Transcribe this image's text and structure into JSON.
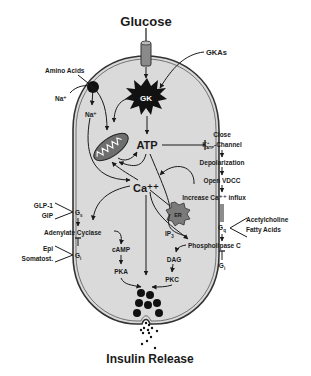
{
  "title": "Glucose",
  "footer": "Insulin Release",
  "inputs": {
    "gkas": "GKAs",
    "amino_acids": "Amino Acids",
    "na_out": "Na⁺",
    "na_in": "Na⁺"
  },
  "core": {
    "gk": "GK",
    "mito": "Mito",
    "atp": "ATP",
    "ca": "Ca⁺⁺",
    "er": "ER"
  },
  "katp_pathway": {
    "close": "Close",
    "channel_k": "K",
    "channel_sub": "ATP",
    "channel_sup": "+",
    "channel_rest": "-Channel",
    "depolarization": "Depolarization",
    "open_vdcc": "Open VDCC",
    "increase_ca": "Increase Ca⁺⁺ influx"
  },
  "left_receptors": {
    "glp1": "GLP-1",
    "gip": "GIP",
    "gs_main": "G",
    "gs_sub": "s",
    "adenylate_cyclase": "Adenylate Cyclase",
    "epi": "Epi",
    "somatost": "Somatost.",
    "gi_main": "G",
    "gi_sub": "i",
    "camp": "cAMP",
    "pka": "PKA"
  },
  "right_receptors": {
    "acetylcholine": "Acetylcholine",
    "fatty_acids": "Fatty Acids",
    "gq_main": "G",
    "gq_sub": "q",
    "phospholipase_c": "Phospholipase C",
    "gi_main": "G",
    "gi_sub": "i",
    "ip3_main": "IP",
    "ip3_sub": "3",
    "dag": "DAG",
    "pkc": "PKC"
  },
  "colors": {
    "cell_fill": "#d9d9d9",
    "membrane": "#333333",
    "granule": "#111111",
    "er_fill": "#7a7a7a"
  }
}
